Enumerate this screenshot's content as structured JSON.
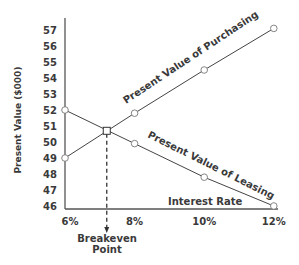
{
  "chart_data": {
    "type": "line",
    "title": "",
    "xlabel": "Interest Rate",
    "ylabel": "Present Value ($000)",
    "x": [
      6,
      8,
      10,
      12
    ],
    "x_tick_labels": [
      "6%",
      "8%",
      "10%",
      "12%"
    ],
    "y_ticks": [
      46,
      47,
      48,
      49,
      50,
      51,
      52,
      53,
      54,
      55,
      56,
      57
    ],
    "ylim": [
      46,
      57
    ],
    "xlim": [
      6,
      12
    ],
    "grid": false,
    "legend": "none (inline line labels)",
    "series": [
      {
        "name": "Present Value of Purchasing",
        "values": [
          49.0,
          51.8,
          54.5,
          57.1
        ]
      },
      {
        "name": "Present Value of Leasing",
        "values": [
          52.0,
          49.9,
          47.8,
          46.0
        ]
      }
    ],
    "annotations": [
      {
        "text": "Breakeven Point",
        "x": 7.2,
        "y": 50.7,
        "style": "dashed vertical arrow down to x-axis"
      }
    ]
  },
  "labels": {
    "purchasing": "Present Value of Purchasing",
    "leasing": "Present Value of Leasing",
    "xaxis": "Interest Rate",
    "yaxis": "Present Value ($000)",
    "breakeven_line1": "Breakeven",
    "breakeven_line2": "Point"
  }
}
